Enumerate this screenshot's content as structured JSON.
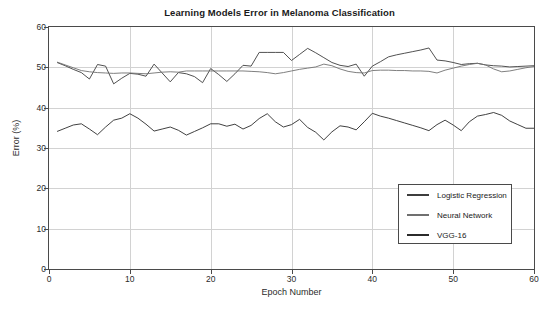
{
  "chart_data": {
    "type": "line",
    "title": "Learning Models Error in Melanoma Classification",
    "xlabel": "Epoch Number",
    "ylabel": "Error (%)",
    "xlim": [
      0,
      60
    ],
    "ylim": [
      0,
      60
    ],
    "xticks": [
      0,
      10,
      20,
      30,
      40,
      50,
      60
    ],
    "yticks": [
      0,
      10,
      20,
      30,
      40,
      50,
      60
    ],
    "grid": true,
    "legend_position": "lower right",
    "x": [
      1,
      2,
      3,
      4,
      5,
      6,
      7,
      8,
      9,
      10,
      11,
      12,
      13,
      14,
      15,
      16,
      17,
      18,
      19,
      20,
      21,
      22,
      23,
      24,
      25,
      26,
      27,
      28,
      29,
      30,
      31,
      32,
      33,
      34,
      35,
      36,
      37,
      38,
      39,
      40,
      41,
      42,
      43,
      44,
      45,
      46,
      47,
      48,
      49,
      50,
      51,
      52,
      53,
      54,
      55,
      56,
      57,
      58,
      59,
      60
    ],
    "series": [
      {
        "name": "Logistic Regression",
        "color": "#3d3d3d",
        "values": [
          51.2,
          50.4,
          49.5,
          48.7,
          47.1,
          50.7,
          50.3,
          45.9,
          47.3,
          48.5,
          48.3,
          47.8,
          50.8,
          48.6,
          46.4,
          48.7,
          48.4,
          47.7,
          46.2,
          49.7,
          48.2,
          46.5,
          48.4,
          50.5,
          50.3,
          53.7,
          53.7,
          53.7,
          53.7,
          51.7,
          53.2,
          54.7,
          53.6,
          52.4,
          51.2,
          50.5,
          50.2,
          50.8,
          47.8,
          50.3,
          51.4,
          52.6,
          53.1,
          53.5,
          53.9,
          54.3,
          54.8,
          51.8,
          51.6,
          51.2,
          50.7,
          50.9,
          51.0,
          50.6,
          50.4,
          50.3,
          50.1,
          50.2,
          50.3,
          50.4
        ]
      },
      {
        "name": "Neural Network",
        "color": "#707070",
        "values": [
          51.3,
          50.6,
          49.9,
          49.2,
          48.9,
          48.7,
          48.6,
          48.5,
          48.6,
          48.6,
          48.5,
          48.4,
          48.6,
          48.8,
          48.9,
          48.8,
          49.1,
          49.1,
          49.1,
          49.1,
          49.1,
          49.1,
          49.1,
          49.1,
          49.0,
          48.9,
          48.7,
          48.4,
          48.7,
          49.1,
          49.5,
          49.8,
          50.1,
          50.8,
          50.4,
          49.6,
          49.0,
          48.7,
          48.6,
          49.2,
          49.3,
          49.3,
          49.2,
          49.2,
          49.1,
          49.1,
          49.0,
          48.6,
          49.3,
          49.8,
          50.3,
          50.7,
          51.0,
          50.6,
          49.6,
          48.9,
          49.1,
          49.5,
          49.9,
          50.2
        ]
      },
      {
        "name": "VGG-16",
        "color": "#2b2b2b",
        "values": [
          34.1,
          34.9,
          35.7,
          36.0,
          34.7,
          33.3,
          35.2,
          36.9,
          37.4,
          38.5,
          37.4,
          35.9,
          34.2,
          34.7,
          35.2,
          34.4,
          33.2,
          34.1,
          35.0,
          36.0,
          36.0,
          35.4,
          35.9,
          34.7,
          35.6,
          37.3,
          38.5,
          36.5,
          35.2,
          35.8,
          37.1,
          35.1,
          33.9,
          32.0,
          34.0,
          35.5,
          35.2,
          34.5,
          36.5,
          38.6,
          37.9,
          37.4,
          36.8,
          36.2,
          35.6,
          35.0,
          34.3,
          35.8,
          36.9,
          35.7,
          34.3,
          36.5,
          37.9,
          38.3,
          38.8,
          38.1,
          36.7,
          35.8,
          34.9,
          34.9
        ]
      }
    ]
  },
  "axis": {
    "y_tick_labels": [
      "60",
      "50",
      "40",
      "30",
      "20",
      "10",
      "0"
    ],
    "x_tick_labels": [
      "0",
      "10",
      "20",
      "30",
      "40",
      "50",
      "60"
    ]
  }
}
